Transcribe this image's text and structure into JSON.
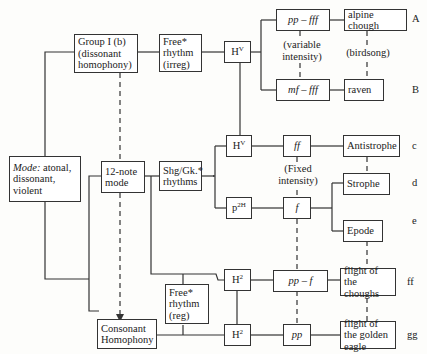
{
  "nodes": {
    "mode": {
      "label_italic": "Mode:",
      "label_rest": " atonal, dissonant, violent"
    },
    "group1": {
      "label": "Group I (b) (dissonant homophony)"
    },
    "free_irreg": {
      "label": "Free* rhythm (irreg)"
    },
    "hv_top": {
      "base": "H",
      "sup": "V"
    },
    "pp_fff": {
      "label": "pp – fff"
    },
    "mf_fff": {
      "label": "mf – fff"
    },
    "alpine_chough": {
      "label": "alpine chough"
    },
    "raven": {
      "label": "raven"
    },
    "variable_intensity": {
      "label": "(variable intensity)"
    },
    "birdsong": {
      "label": "(birdsong)"
    },
    "twelve_note": {
      "label": "12-note mode"
    },
    "shg_gk": {
      "label": "Shg/Gk.* rhythms"
    },
    "hv_mid": {
      "base": "H",
      "sup": "V"
    },
    "p2h": {
      "base": "p",
      "sup": "2H"
    },
    "ff": {
      "label": "ff"
    },
    "f": {
      "label": "f"
    },
    "fixed_intensity": {
      "label": "(Fixed intensity)"
    },
    "antistrophe": {
      "label": "Antistrophe"
    },
    "strophe": {
      "label": "Strophe"
    },
    "epode": {
      "label": "Epode"
    },
    "h2_upper": {
      "base": "H",
      "sup": "2"
    },
    "h2_lower": {
      "base": "H",
      "sup": "2"
    },
    "free_reg": {
      "label": "Free* rhythm (reg)"
    },
    "pp_f": {
      "label": "pp – f"
    },
    "pp": {
      "label": "pp"
    },
    "choughs_flight": {
      "label": "flight of the choughs"
    },
    "eagle_flight": {
      "label": "flight of the golden eagle"
    },
    "consonant": {
      "label": "Consonant Homophony"
    }
  },
  "row_labels": [
    "A",
    "B",
    "c",
    "d",
    "e",
    "ff",
    "gg"
  ]
}
